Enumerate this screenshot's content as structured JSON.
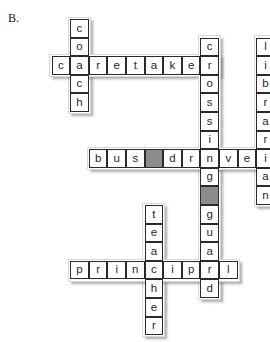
{
  "label": "B.",
  "grid": {
    "cell_size": 18.6,
    "origin_x": 33.0,
    "origin_y": 19.0,
    "cols": 13,
    "rows": 18,
    "blank_cell_color": "#8c8c8c",
    "cell_fill": "#ffffff",
    "cell_border": "#2b2b2b"
  },
  "entries": [
    {
      "id": "coach",
      "answer": "coach",
      "direction": "down",
      "col": 2,
      "row": 0,
      "letters": [
        "c",
        "o",
        "a",
        "c",
        "h"
      ]
    },
    {
      "id": "caretaker",
      "answer": "caretaker",
      "direction": "across",
      "col": 1,
      "row": 2,
      "letters": [
        "c",
        "a",
        "r",
        "e",
        "t",
        "a",
        "k",
        "e",
        "r"
      ]
    },
    {
      "id": "crossing-guard",
      "answer": "crossing guard",
      "direction": "down",
      "col": 9,
      "row": 1,
      "letters": [
        "c",
        "r",
        "o",
        "s",
        "s",
        "i",
        "n",
        "g",
        " ",
        "g",
        "u",
        "a",
        "r",
        "d"
      ]
    },
    {
      "id": "librarian",
      "answer": "librarian",
      "direction": "down",
      "col": 12,
      "row": 1,
      "letters": [
        "l",
        "i",
        "b",
        "r",
        "a",
        "r",
        "i",
        "a",
        "n"
      ]
    },
    {
      "id": "bus-driver",
      "answer": "bus driver",
      "direction": "across",
      "col": 3,
      "row": 7,
      "letters": [
        "b",
        "u",
        "s",
        " ",
        "d",
        "r",
        "i",
        "v",
        "e",
        "r"
      ]
    },
    {
      "id": "teacher",
      "answer": "teacher",
      "direction": "down",
      "col": 6,
      "row": 10,
      "letters": [
        "t",
        "e",
        "a",
        "c",
        "h",
        "e",
        "r"
      ]
    },
    {
      "id": "principal",
      "answer": "principal",
      "direction": "across",
      "col": 2,
      "row": 13,
      "letters": [
        "p",
        "r",
        "i",
        "n",
        "c",
        "i",
        "p",
        "a",
        "l"
      ]
    }
  ]
}
